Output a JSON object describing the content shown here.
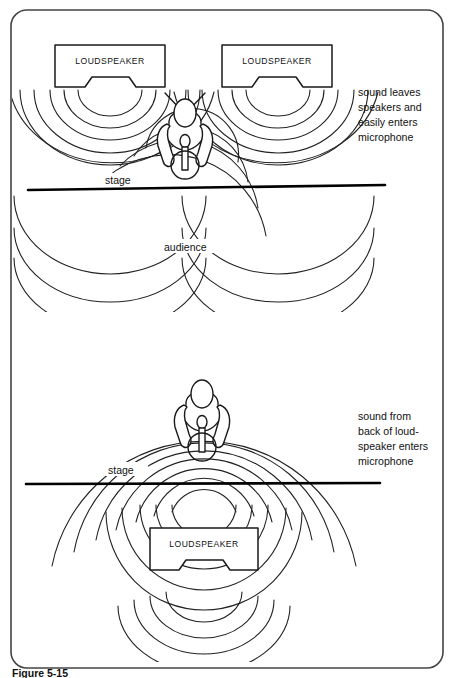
{
  "figure": {
    "caption": "Figure 5-15",
    "border_color": "#3a3a3a",
    "ink_color": "#1a1a1a",
    "wave_color": "#222222",
    "background": "#ffffff"
  },
  "panels": [
    {
      "id": "top-panel",
      "annotation": "sound leaves\nspeakers and\neasily enters\nmicrophone",
      "annotation_lines": [
        "sound leaves",
        "speakers and",
        "easily enters",
        "microphone"
      ],
      "stage_label": "stage",
      "audience_label": "audience",
      "speakers": [
        {
          "label": "LOUDSPEAKER",
          "position": "left"
        },
        {
          "label": "LOUDSPEAKER",
          "position": "right"
        }
      ],
      "performer": "singer-with-microphone"
    },
    {
      "id": "bottom-panel",
      "annotation": "sound from\nback of loud-\nspeaker enters\nmicrophone",
      "annotation_lines": [
        "sound from",
        "back of loud-",
        "speaker enters",
        "microphone"
      ],
      "stage_label": "stage",
      "speakers": [
        {
          "label": "LOUDSPEAKER",
          "position": "center-front"
        }
      ],
      "performer": "singer-with-microphone"
    }
  ],
  "labels": {
    "loudspeaker": "LOUDSPEAKER",
    "stage": "stage",
    "audience": "audience"
  },
  "annotations": {
    "top_line1": "sound leaves",
    "top_line2": "speakers and",
    "top_line3": "easily enters",
    "top_line4": "microphone",
    "bottom_line1": "sound from",
    "bottom_line2": "back of loud-",
    "bottom_line3": "speaker enters",
    "bottom_line4": "microphone"
  },
  "caption": {
    "text": "Figure 5-15"
  }
}
